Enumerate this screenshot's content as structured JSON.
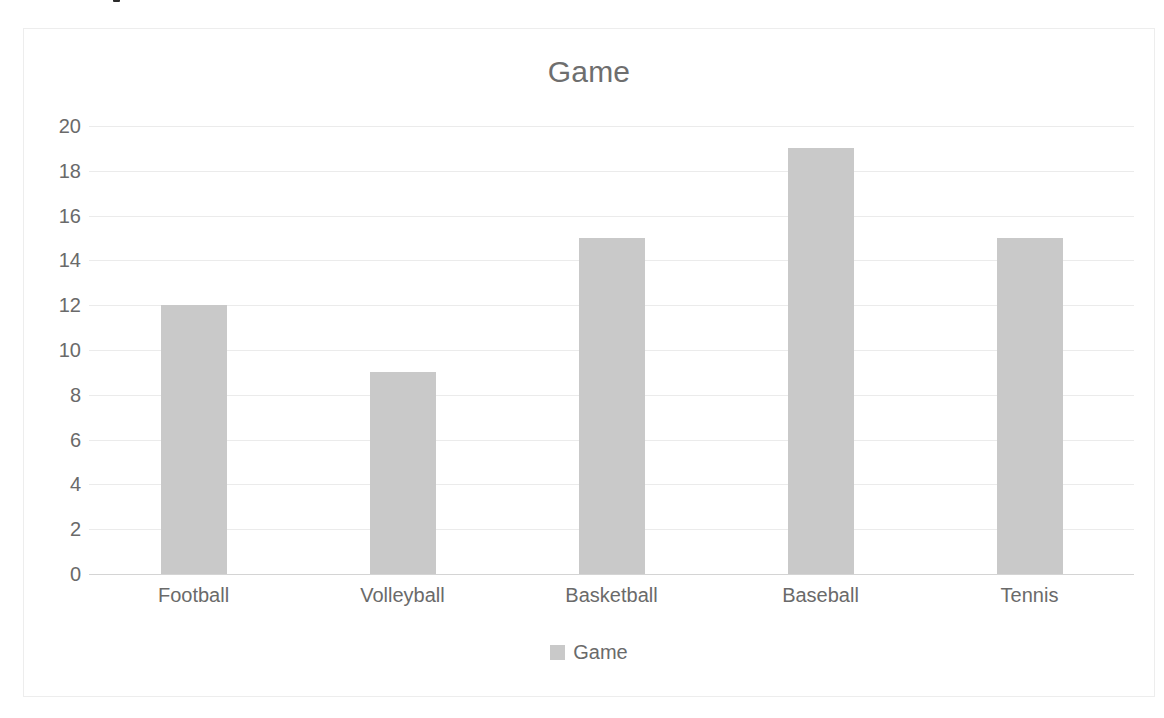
{
  "chart_data": {
    "type": "bar",
    "title": "Game",
    "categories": [
      "Football",
      "Volleyball",
      "Basketball",
      "Baseball",
      "Tennis"
    ],
    "values": [
      12,
      9,
      15,
      19,
      15
    ],
    "series": [
      {
        "name": "Game",
        "values": [
          12,
          9,
          15,
          19,
          15
        ]
      }
    ],
    "xlabel": "",
    "ylabel": "",
    "ylim": [
      0,
      20
    ],
    "yticks": [
      0,
      2,
      4,
      6,
      8,
      10,
      12,
      14,
      16,
      18,
      20
    ],
    "ytick_labels": [
      "0",
      "2",
      "4",
      "6",
      "8",
      "10",
      "12",
      "14",
      "16",
      "18",
      "20"
    ],
    "grid": true,
    "legend": {
      "position": "bottom",
      "entries": [
        {
          "label": "Game",
          "color": "#c9c9c9"
        }
      ]
    },
    "colors": {
      "bar": "#c9c9c9",
      "gridline": "#ebebeb",
      "axis": "#d4d4d4",
      "text": "#6a6a6a",
      "title": "#6e6e6e",
      "frame": "#ededed",
      "background": "#ffffff"
    }
  }
}
